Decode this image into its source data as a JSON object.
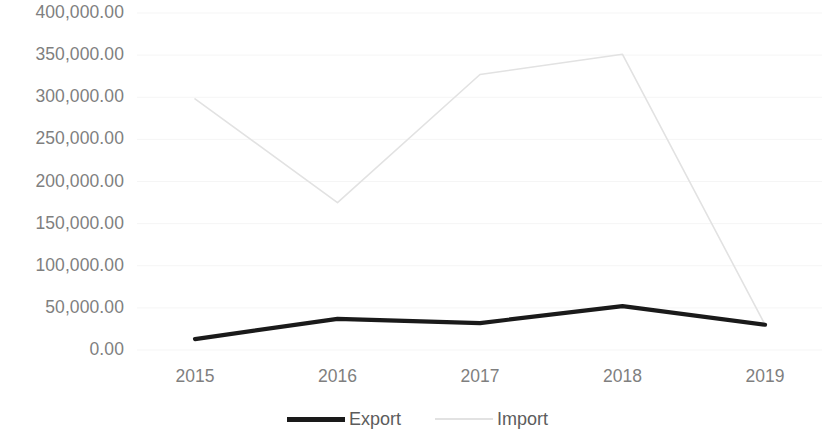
{
  "chart_data": {
    "type": "line",
    "title": "",
    "subtitle": "",
    "xlabel": "",
    "ylabel": "",
    "categories": [
      "2015",
      "2016",
      "2017",
      "2018",
      "2019"
    ],
    "series": [
      {
        "name": "Export",
        "color": "#1a1a1a",
        "values": [
          13000,
          37000,
          32000,
          52000,
          30000
        ]
      },
      {
        "name": "Import",
        "color": "#e2e2e2",
        "values": [
          298000,
          175000,
          327000,
          351000,
          30000
        ]
      }
    ],
    "ylim": [
      0,
      400000
    ],
    "ytick_values": [
      0,
      50000,
      100000,
      150000,
      200000,
      250000,
      300000,
      350000,
      400000
    ],
    "ytick_labels": [
      "0.00",
      "50,000.00",
      "100,000.00",
      "150,000.00",
      "200,000.00",
      "250,000.00",
      "300,000.00",
      "350,000.00",
      "400,000.00"
    ],
    "grid": true,
    "grid_color": "#f5f5f5",
    "legend_position": "bottom",
    "background": "#ffffff"
  },
  "legend": {
    "items": [
      {
        "label": "Export",
        "marker": "thick-black-line"
      },
      {
        "label": "Import",
        "marker": "thin-light-gray-line"
      }
    ]
  },
  "axis": {
    "tick_color": "#7f7f7f"
  }
}
